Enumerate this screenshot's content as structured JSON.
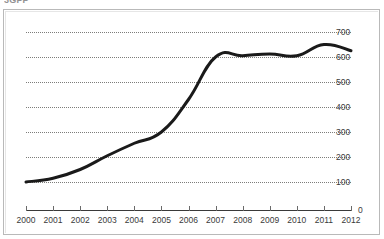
{
  "caption": "3GPP",
  "chart_data": {
    "type": "line",
    "title": "",
    "subtitle": "",
    "xlabel": "",
    "ylabel": "",
    "categories": [
      "2000",
      "2001",
      "2002",
      "2003",
      "2004",
      "2005",
      "2006",
      "2007",
      "2008",
      "2009",
      "2010",
      "2011",
      "2012"
    ],
    "x": [
      2000,
      2001,
      2002,
      2003,
      2004,
      2005,
      2006,
      2007,
      2008,
      2009,
      2010,
      2011,
      2012
    ],
    "values": [
      100,
      115,
      150,
      205,
      255,
      300,
      430,
      600,
      605,
      612,
      605,
      650,
      625
    ],
    "series": [
      {
        "name": "series-1",
        "values": [
          100,
          115,
          150,
          205,
          255,
          300,
          430,
          600,
          605,
          612,
          605,
          650,
          625
        ],
        "color": "#1a1a1a"
      }
    ],
    "ylim": [
      0,
      700
    ],
    "xlim": [
      2000,
      2012
    ],
    "yticks": [
      0,
      100,
      200,
      300,
      400,
      500,
      600,
      700
    ],
    "ytick_labels": [
      "0",
      "100",
      "200",
      "300",
      "400",
      "500",
      "600",
      "700"
    ],
    "xticks": [
      "2000",
      "2001",
      "2002",
      "2003",
      "2004",
      "2005",
      "2006",
      "2007",
      "2008",
      "2009",
      "2010",
      "2011",
      "2012"
    ],
    "y_axis_position": "right",
    "grid": true,
    "grid_style": "dotted",
    "grid_color": "#7d7d7a",
    "legend": false,
    "legend_position": "none",
    "line_color": "#1a1a1a",
    "line_width": 3,
    "markers": false,
    "background": "#ffffff",
    "border_color": "#b9b9b9",
    "annotations": []
  }
}
